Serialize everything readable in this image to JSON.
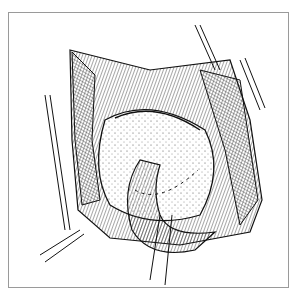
{
  "illustration": {
    "subject": "surgical-line-drawing",
    "frame_color": "#9a9a9a",
    "ink_color": "#111111",
    "background": "#ffffff",
    "elements": [
      {
        "name": "retracted-wound-edges"
      },
      {
        "name": "stippled-organ-surface"
      },
      {
        "name": "suture-line"
      },
      {
        "name": "tubular-structure"
      },
      {
        "name": "retractor-strips"
      }
    ]
  }
}
